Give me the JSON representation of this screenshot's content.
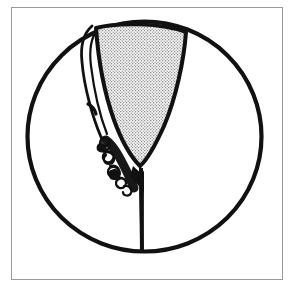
{
  "figure": {
    "caption": "",
    "background_color": "#ffffff",
    "ink_color": "#111111",
    "stipple_color": "#8c8c8c",
    "border": {
      "name": "frame-border",
      "color": "#9a9a9a",
      "stroke_width": 1,
      "x": 11,
      "y": 7,
      "width": 271,
      "height": 272
    },
    "circle": {
      "name": "outer-circle",
      "center_x": 144.5,
      "center_y": 136.5,
      "radius_x": 117,
      "radius_y": 115,
      "stroke_width": 4.2,
      "fill": "none"
    },
    "shield": {
      "name": "stippled-shield",
      "description": "large stippled triangular shield shape with curved top",
      "fill_pattern": "stipple-dots",
      "outline_width": 4,
      "apex_x": 140,
      "apex_y": 166,
      "top_left_x": 96,
      "top_left_y": 28,
      "top_right_x": 186,
      "top_right_y": 32
    },
    "sliver": {
      "name": "left-sliver-flap",
      "description": "thin white crescent flap along the left side of the shield",
      "stroke_width": 2.6
    },
    "scribble": {
      "name": "curly-scribble-chain",
      "description": "chain of looped curly marks along lower-left margin",
      "loop_count": 14,
      "stroke_width": 2.2,
      "start_x": 101,
      "start_y": 138,
      "end_x": 134,
      "end_y": 192
    },
    "stem": {
      "name": "vertical-stem-line",
      "description": "thick vertical line descending from shield apex to circle base",
      "top_x": 141,
      "top_y": 166,
      "bottom_x": 142,
      "bottom_y": 252,
      "stroke_width": 4
    }
  }
}
